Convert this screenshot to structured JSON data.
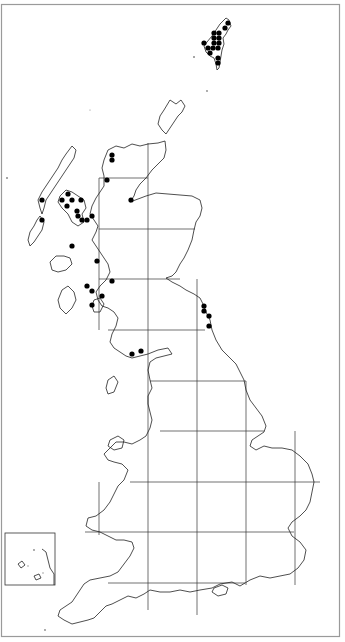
{
  "map": {
    "title": "Distribution map – Great Britain (10 km hectad records)",
    "region": "Great Britain",
    "colors": {
      "coast": "#222222",
      "grid": "#333333",
      "dot": "#000000",
      "frame": "#9a9a9a",
      "background": "#ffffff"
    },
    "grid": {
      "vertical_x": [
        99,
        148,
        197,
        246,
        295
      ],
      "horizontal_y": [
        178,
        229,
        279,
        330,
        381,
        431,
        482,
        532,
        583
      ]
    },
    "inset": {
      "label": "Channel Islands",
      "x": 5,
      "y": 533,
      "w": 50,
      "h": 52
    },
    "records": [
      {
        "region": "Shetland",
        "x": 228,
        "y": 23
      },
      {
        "region": "Shetland",
        "x": 225,
        "y": 28
      },
      {
        "region": "Shetland",
        "x": 214,
        "y": 33
      },
      {
        "region": "Shetland",
        "x": 219,
        "y": 33
      },
      {
        "region": "Shetland",
        "x": 214,
        "y": 38
      },
      {
        "region": "Shetland",
        "x": 219,
        "y": 38
      },
      {
        "region": "Shetland",
        "x": 204,
        "y": 43
      },
      {
        "region": "Shetland",
        "x": 214,
        "y": 43
      },
      {
        "region": "Shetland",
        "x": 219,
        "y": 43
      },
      {
        "region": "Shetland",
        "x": 208,
        "y": 48
      },
      {
        "region": "Shetland",
        "x": 213,
        "y": 48
      },
      {
        "region": "Shetland",
        "x": 218,
        "y": 48
      },
      {
        "region": "Shetland",
        "x": 210,
        "y": 53
      },
      {
        "region": "Shetland",
        "x": 218,
        "y": 58
      },
      {
        "region": "Shetland",
        "x": 218,
        "y": 63
      },
      {
        "region": "NW Sutherland",
        "x": 112,
        "y": 155
      },
      {
        "region": "NW Sutherland",
        "x": 112,
        "y": 160
      },
      {
        "region": "Wester Ross",
        "x": 107,
        "y": 180
      },
      {
        "region": "Easter Ross",
        "x": 131,
        "y": 200
      },
      {
        "region": "Outer Hebrides",
        "x": 42,
        "y": 200
      },
      {
        "region": "Outer Hebrides",
        "x": 42,
        "y": 220
      },
      {
        "region": "Skye",
        "x": 68,
        "y": 194
      },
      {
        "region": "Skye",
        "x": 62,
        "y": 200
      },
      {
        "region": "Skye",
        "x": 72,
        "y": 200
      },
      {
        "region": "Skye",
        "x": 67,
        "y": 206
      },
      {
        "region": "Skye",
        "x": 81,
        "y": 200
      },
      {
        "region": "Skye",
        "x": 77,
        "y": 211
      },
      {
        "region": "Skye",
        "x": 78,
        "y": 216
      },
      {
        "region": "Lochalsh",
        "x": 82,
        "y": 220
      },
      {
        "region": "Lochalsh",
        "x": 87,
        "y": 220
      },
      {
        "region": "Lochalsh",
        "x": 92,
        "y": 216
      },
      {
        "region": "Lochaber",
        "x": 72,
        "y": 246
      },
      {
        "region": "Argyll",
        "x": 97,
        "y": 261
      },
      {
        "region": "Argyll",
        "x": 112,
        "y": 281
      },
      {
        "region": "Argyll",
        "x": 87,
        "y": 286
      },
      {
        "region": "Argyll",
        "x": 92,
        "y": 291
      },
      {
        "region": "Argyll",
        "x": 102,
        "y": 296
      },
      {
        "region": "Argyll",
        "x": 92,
        "y": 305
      },
      {
        "region": "Galloway",
        "x": 132,
        "y": 354
      },
      {
        "region": "Galloway",
        "x": 141,
        "y": 351
      },
      {
        "region": "Northumberland",
        "x": 204,
        "y": 306
      },
      {
        "region": "Northumberland",
        "x": 204,
        "y": 311
      },
      {
        "region": "Northumberland",
        "x": 209,
        "y": 316
      },
      {
        "region": "Northumberland",
        "x": 209,
        "y": 326
      }
    ]
  }
}
